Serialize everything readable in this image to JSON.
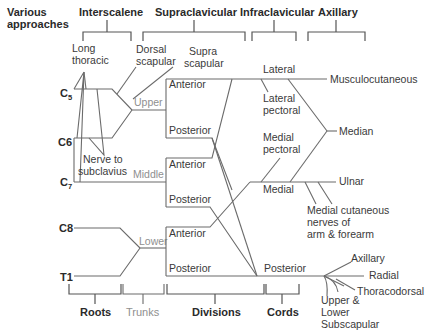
{
  "headers": {
    "approaches_line1": "Various",
    "approaches_line2": "approaches",
    "interscalene": "Interscalene",
    "supraclavicular": "Supraclavicular",
    "infraclavicular": "Infraclavicular",
    "axillary": "Axillary"
  },
  "roots": {
    "c5": "C",
    "c5_sub": "5",
    "c6": "C6",
    "c7": "C",
    "c7_sub": "7",
    "c8": "C8",
    "t1": "T1"
  },
  "trunks": {
    "upper": "Upper",
    "middle": "Middle",
    "lower": "Lower"
  },
  "divisions": {
    "upper_anterior": "Anterior",
    "upper_posterior": "Posterior",
    "middle_anterior": "Anterior",
    "middle_posterior": "Posterior",
    "lower_anterior": "Anterior",
    "lower_posterior": "Posterior"
  },
  "cords": {
    "lateral": "Lateral",
    "medial": "Medial",
    "posterior": "Posterior"
  },
  "branches": {
    "long_thoracic_1": "Long",
    "long_thoracic_2": "thoracic",
    "dorsal_scapular_1": "Dorsal",
    "dorsal_scapular_2": "scapular",
    "suprascapular_1": "Supra",
    "suprascapular_2": "scapular",
    "nerve_to_subclavius_1": "Nerve to",
    "nerve_to_subclavius_2": "subclavius",
    "lateral_pectoral_1": "Lateral",
    "lateral_pectoral_2": "pectoral",
    "medial_pectoral_1": "Medial",
    "medial_pectoral_2": "pectoral",
    "musculocutaneous": "Musculocutaneous",
    "median": "Median",
    "ulnar": "Ulnar",
    "medial_cutaneous_1": "Medial cutaneous",
    "medial_cutaneous_2": "nerves of",
    "medial_cutaneous_3": "arm & forearm",
    "axillary": "Axillary",
    "radial": "Radial",
    "thoracodorsal": "Thoracodorsal",
    "subscapular_1": "Upper &",
    "subscapular_2": "Lower",
    "subscapular_3": "Subscapular"
  },
  "footer": {
    "roots": "Roots",
    "trunks": "Trunks",
    "divisions": "Divisions",
    "cords": "Cords"
  }
}
